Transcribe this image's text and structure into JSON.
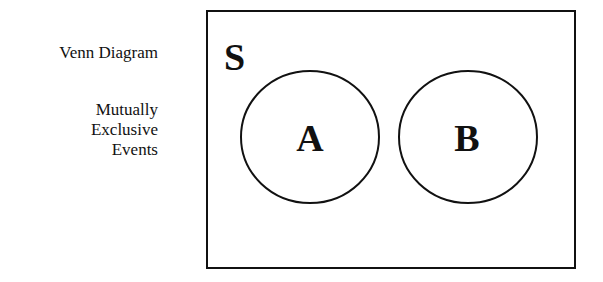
{
  "labels": {
    "title": "Venn Diagram",
    "subtitle_lines": [
      "Mutually",
      "Exclusive",
      "Events"
    ]
  },
  "diagram": {
    "sample_space_label": "S",
    "sets": [
      {
        "label": "A"
      },
      {
        "label": "B"
      }
    ]
  }
}
